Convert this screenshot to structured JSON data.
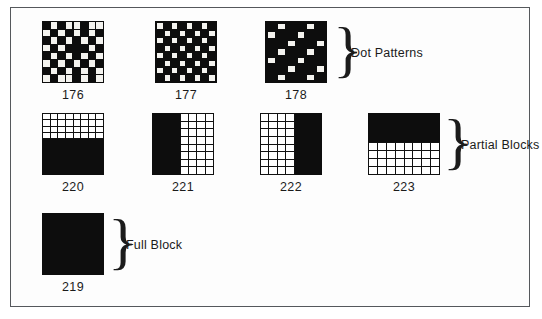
{
  "page": {
    "background_color": "#ffffff",
    "frame_color": "#55585c",
    "ink_color": "#0d0d0d"
  },
  "groups": [
    {
      "id": "dot-patterns",
      "label": "Dot Patterns",
      "brace": "}",
      "specimens": [
        {
          "code": "176",
          "name": "light-shade-dot-pattern",
          "type": "dot",
          "cols": 8,
          "rows": 8,
          "description": "dense irregular dot mesh",
          "on_cells": [
            0,
            1,
            0,
            1,
            1,
            0,
            1,
            1,
            1,
            0,
            1,
            0,
            1,
            0,
            1,
            0,
            0,
            1,
            0,
            1,
            0,
            1,
            0,
            1,
            1,
            0,
            1,
            0,
            0,
            0,
            1,
            0,
            0,
            1,
            0,
            1,
            0,
            1,
            0,
            1,
            1,
            0,
            1,
            0,
            1,
            0,
            1,
            0,
            0,
            1,
            0,
            1,
            0,
            1,
            0,
            1,
            1,
            0,
            1,
            1,
            0,
            1,
            0,
            1
          ]
        },
        {
          "code": "177",
          "name": "medium-shade-checkerboard",
          "type": "dot",
          "cols": 8,
          "rows": 8,
          "description": "regular checkerboard of white squares on black",
          "on_cells": [
            1,
            0,
            1,
            0,
            1,
            0,
            1,
            0,
            0,
            1,
            0,
            1,
            0,
            1,
            0,
            1,
            1,
            0,
            1,
            0,
            1,
            0,
            1,
            0,
            0,
            1,
            0,
            1,
            0,
            1,
            0,
            1,
            1,
            0,
            1,
            0,
            1,
            0,
            1,
            0,
            0,
            1,
            0,
            1,
            0,
            1,
            0,
            1,
            1,
            0,
            1,
            0,
            1,
            0,
            1,
            0,
            0,
            1,
            0,
            1,
            0,
            1,
            0,
            1
          ]
        },
        {
          "code": "178",
          "name": "dark-shade-sparse-dots",
          "type": "dot",
          "cols": 6,
          "rows": 7,
          "description": "sparse white dots on black field",
          "on_cells": [
            0,
            1,
            0,
            0,
            1,
            0,
            1,
            0,
            0,
            1,
            0,
            0,
            0,
            0,
            1,
            0,
            0,
            1,
            0,
            1,
            0,
            0,
            1,
            0,
            1,
            0,
            0,
            1,
            0,
            0,
            0,
            0,
            1,
            0,
            0,
            1,
            0,
            1,
            0,
            0,
            1,
            0
          ]
        }
      ]
    },
    {
      "id": "partial-blocks",
      "label": "Partial Blocks",
      "brace": "}",
      "specimens": [
        {
          "code": "220",
          "name": "lower-half-block",
          "type": "partial",
          "orientation": "vertical",
          "solid_side": "bottom",
          "solid_fraction": 58,
          "mesh_cols": 8,
          "mesh_rows": 4,
          "description": "grid above, solid black lower portion"
        },
        {
          "code": "221",
          "name": "left-half-block",
          "type": "partial",
          "orientation": "horizontal",
          "solid_side": "left",
          "solid_fraction": 45,
          "mesh_cols": 4,
          "mesh_rows": 8,
          "description": "solid black left portion, grid at right"
        },
        {
          "code": "222",
          "name": "right-half-block",
          "type": "partial",
          "orientation": "horizontal",
          "solid_side": "right",
          "solid_fraction": 44,
          "mesh_cols": 4,
          "mesh_rows": 8,
          "description": "grid at left, solid black right portion"
        },
        {
          "code": "223",
          "name": "upper-half-block",
          "type": "partial",
          "orientation": "vertical",
          "solid_side": "top",
          "solid_fraction": 46,
          "mesh_cols": 8,
          "mesh_rows": 4,
          "description": "solid black upper portion, grid below"
        }
      ]
    },
    {
      "id": "full-block",
      "label": "Full Block",
      "brace": "}",
      "specimens": [
        {
          "code": "219",
          "name": "full-block",
          "type": "solid",
          "description": "completely filled black square"
        }
      ]
    }
  ]
}
